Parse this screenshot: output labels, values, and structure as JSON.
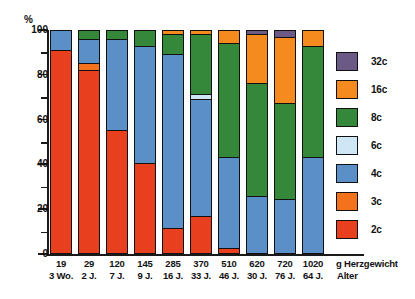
{
  "chart_data": {
    "type": "bar",
    "subtype": "stacked-percentage",
    "title": "",
    "xlabel": "g Herzgewicht / Alter",
    "ylabel": "%",
    "ylim": [
      0,
      100
    ],
    "yticks": [
      0,
      20,
      40,
      60,
      80,
      100
    ],
    "ytick_labels": [
      "0",
      "20",
      "40",
      "60",
      "80",
      "100"
    ],
    "y_minor_ticks": [
      10,
      30,
      50,
      70,
      90
    ],
    "grid": false,
    "legend_position": "right",
    "categories": [
      "19",
      "29",
      "120",
      "145",
      "285",
      "370",
      "510",
      "620",
      "720",
      "1020"
    ],
    "category_sublabels": [
      "3 Wo.",
      "2 J.",
      "7 J.",
      "9 J.",
      "16 J.",
      "33 J.",
      "46 J.",
      "30 J.",
      "76 J.",
      "64 J."
    ],
    "series": [
      {
        "name": "2c",
        "color": "#e8401f",
        "values": [
          91,
          82,
          55,
          40,
          11,
          16,
          2,
          0,
          0,
          0
        ]
      },
      {
        "name": "3c",
        "color": "#f4721c",
        "values": [
          0,
          3,
          0,
          0,
          0,
          0,
          0,
          0,
          0,
          0
        ]
      },
      {
        "name": "4c",
        "color": "#5a8fc8",
        "values": [
          9,
          11,
          41,
          53,
          78,
          53,
          41,
          25,
          24,
          43
        ]
      },
      {
        "name": "6c",
        "color": "#cfe6f5",
        "values": [
          0,
          0,
          0,
          0,
          0,
          2,
          0,
          0,
          0,
          0
        ]
      },
      {
        "name": "8c",
        "color": "#35883a",
        "values": [
          0,
          4,
          4,
          7,
          9,
          27,
          51,
          51,
          43,
          50
        ]
      },
      {
        "name": "16c",
        "color": "#f58a1f",
        "values": [
          0,
          0,
          0,
          0,
          2,
          2,
          6,
          22,
          30,
          7
        ]
      },
      {
        "name": "32c",
        "color": "#6b5a86",
        "values": [
          0,
          0,
          0,
          0,
          0,
          0,
          0,
          2,
          3,
          0
        ]
      }
    ],
    "legend_entries": [
      {
        "label": "32c",
        "color": "#6b5a86"
      },
      {
        "label": "16c",
        "color": "#f58a1f"
      },
      {
        "label": "8c",
        "color": "#35883a"
      },
      {
        "label": "6c",
        "color": "#cfe6f5"
      },
      {
        "label": "4c",
        "color": "#5a8fc8"
      },
      {
        "label": "3c",
        "color": "#f4721c"
      },
      {
        "label": "2c",
        "color": "#e8401f"
      }
    ],
    "axis_caption": {
      "line1": "g Herzgewicht",
      "line2": "Alter"
    },
    "colors": {
      "axis": "#1a1a1a",
      "background": "#ffffff"
    }
  }
}
